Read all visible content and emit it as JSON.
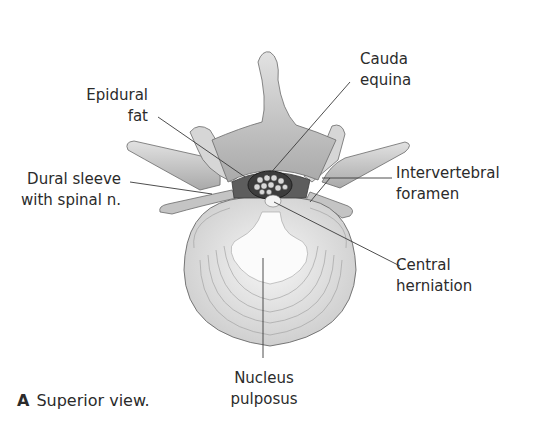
{
  "figure": {
    "caption_letter": "A",
    "caption_text": "Superior view.",
    "colors": {
      "background": "#ffffff",
      "bone": "#d2d2d2",
      "bone_shadow": "#8a8a8a",
      "disc": "#e6e6e6",
      "nucleus": "#fafafa",
      "leader": "#3a3a3a",
      "text": "#2b2b2b"
    }
  },
  "labels": {
    "epidural_fat": {
      "line1": "Epidural",
      "line2": "fat"
    },
    "dural_sleeve": {
      "line1": "Dural sleeve",
      "line2": "with spinal n."
    },
    "cauda_equina": {
      "line1": "Cauda",
      "line2": "equina"
    },
    "intervertebral_foramen": {
      "line1": "Intervertebral",
      "line2": "foramen"
    },
    "central_herniation": {
      "line1": "Central",
      "line2": "herniation"
    },
    "nucleus_pulposus": {
      "line1": "Nucleus",
      "line2": "pulposus"
    }
  }
}
